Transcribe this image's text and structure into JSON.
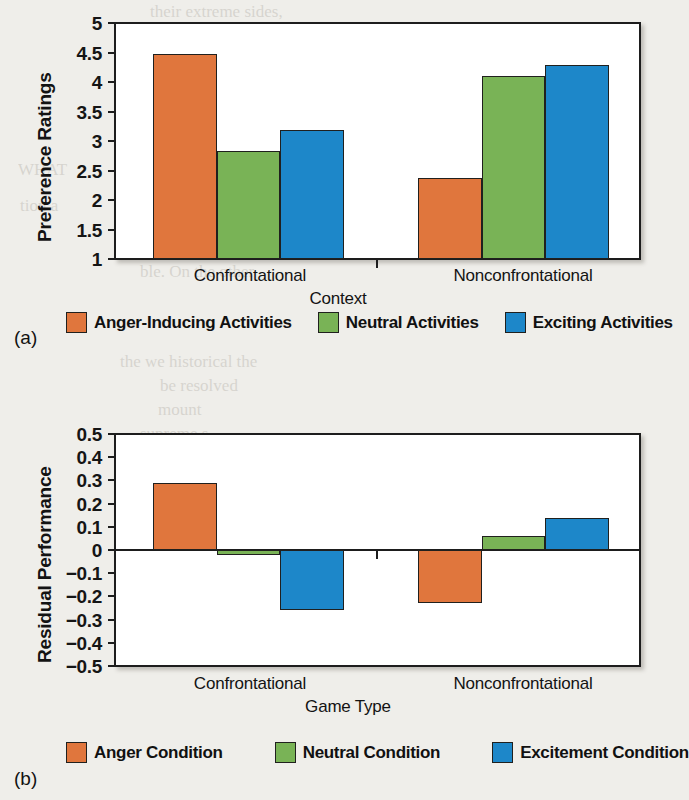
{
  "figure": {
    "panel_a_tag": "(a)",
    "panel_b_tag": "(b)"
  },
  "ghost_text": [
    {
      "t": "their extreme sides,",
      "x": 150,
      "y": 2
    },
    {
      "t": "oint to take away the n",
      "x": 135,
      "y": 26
    },
    {
      "t": "sustained by structur",
      "x": 130,
      "y": 50
    },
    {
      "t": "with a certain view",
      "x": 132,
      "y": 74
    },
    {
      "t": "WHAT",
      "x": 18,
      "y": 160
    },
    {
      "t": "tion a",
      "x": 20,
      "y": 196
    },
    {
      "t": "of good is seen",
      "x": 130,
      "y": 214
    },
    {
      "t": "that and natural in",
      "x": 120,
      "y": 238
    },
    {
      "t": "ble. On the other",
      "x": 140,
      "y": 262
    },
    {
      "t": "the we historical the",
      "x": 120,
      "y": 352
    },
    {
      "t": "be resolved",
      "x": 160,
      "y": 376
    },
    {
      "t": "mount",
      "x": 158,
      "y": 400
    },
    {
      "t": "supreme s",
      "x": 140,
      "y": 424
    },
    {
      "t": "Reality w",
      "x": 150,
      "y": 448
    },
    {
      "t": "purt decisi",
      "x": 140,
      "y": 496
    },
    {
      "t": "message",
      "x": 150,
      "y": 520
    },
    {
      "t": "p. o may",
      "x": 150,
      "y": 548
    },
    {
      "t": "different or",
      "x": 140,
      "y": 572
    },
    {
      "t": "we such re",
      "x": 135,
      "y": 596
    },
    {
      "t": "o some degre",
      "x": 130,
      "y": 620
    }
  ],
  "chart_data": [
    {
      "id": "panel_a",
      "type": "bar",
      "title": "",
      "xlabel": "Context",
      "ylabel": "Preference Ratings",
      "categories": [
        "Confrontational",
        "Nonconfrontational"
      ],
      "ylim": [
        1,
        5
      ],
      "yticks": [
        "5",
        "4.5",
        "4",
        "3.5",
        "3",
        "2.5",
        "2",
        "1.5",
        "1"
      ],
      "ytick_values": [
        5,
        4.5,
        4,
        3.5,
        3,
        2.5,
        2,
        1.5,
        1
      ],
      "grid": false,
      "legend_position": "bottom",
      "series": [
        {
          "name": "Anger-Inducing Activities",
          "color": "#e0763d",
          "values": [
            4.47,
            2.38
          ]
        },
        {
          "name": "Neutral Activities",
          "color": "#79b356",
          "values": [
            2.83,
            4.1
          ]
        },
        {
          "name": "Exciting Activities",
          "color": "#1d87c9",
          "values": [
            3.18,
            4.28
          ]
        }
      ]
    },
    {
      "id": "panel_b",
      "type": "bar",
      "title": "",
      "xlabel": "Game Type",
      "ylabel": "Residual Performance",
      "categories": [
        "Confrontational",
        "Nonconfrontational"
      ],
      "ylim": [
        -0.5,
        0.5
      ],
      "yticks": [
        "0.5",
        "0.4",
        "0.3",
        "0.2",
        "0.1",
        "0",
        "−0.1",
        "−0.2",
        "−0.3",
        "−0.4",
        "−0.5"
      ],
      "ytick_values": [
        0.5,
        0.4,
        0.3,
        0.2,
        0.1,
        0,
        -0.1,
        -0.2,
        -0.3,
        -0.4,
        -0.5
      ],
      "grid": false,
      "legend_position": "bottom",
      "series": [
        {
          "name": "Anger Condition",
          "color": "#e0763d",
          "values": [
            0.29,
            -0.23
          ]
        },
        {
          "name": "Neutral Condition",
          "color": "#79b356",
          "values": [
            -0.02,
            0.06
          ]
        },
        {
          "name": "Excitement Condition",
          "color": "#1d87c9",
          "values": [
            -0.26,
            0.14
          ]
        }
      ]
    }
  ]
}
